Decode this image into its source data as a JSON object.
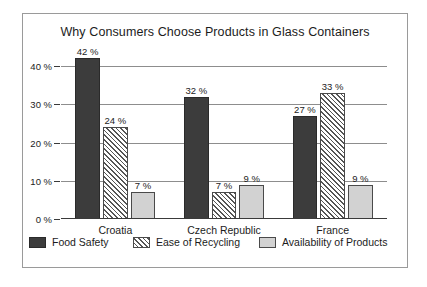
{
  "chart_data": {
    "type": "bar",
    "title": "Why Consumers Choose Products in Glass Containers",
    "xlabel": "",
    "ylabel": "",
    "ylim": [
      0,
      45
    ],
    "grid": true,
    "legend_position": "bottom",
    "categories": [
      "Croatia",
      "Czech Republic",
      "France"
    ],
    "ytick_labels": [
      "0 %",
      "10 %",
      "20 %",
      "30 %",
      "40 %"
    ],
    "ytick_values": [
      0,
      10,
      20,
      30,
      40
    ],
    "series": [
      {
        "name": "Food Safety",
        "style": "solid-dark",
        "color": "#3c3c3c",
        "values": [
          42,
          32,
          27
        ],
        "value_labels": [
          "42 %",
          "32 %",
          "27 %"
        ]
      },
      {
        "name": "Ease of Recycling",
        "style": "diagonal-hatch",
        "color": "#ffffff",
        "values": [
          24,
          7,
          33
        ],
        "value_labels": [
          "24 %",
          "7 %",
          "33 %"
        ]
      },
      {
        "name": "Availability of Products",
        "style": "solid-light",
        "color": "#d2d2d2",
        "values": [
          7,
          9,
          9
        ],
        "value_labels": [
          "7 %",
          "9 %",
          "9 %"
        ]
      }
    ]
  }
}
